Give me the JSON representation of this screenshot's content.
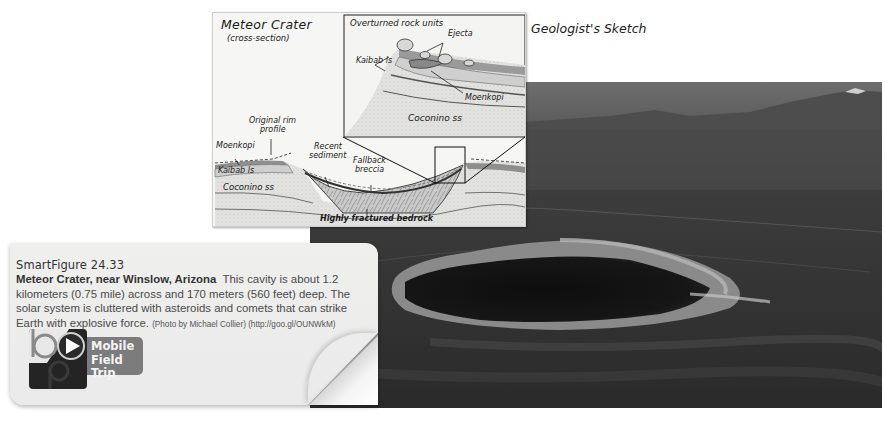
{
  "sketch": {
    "heading": "Geologist's Sketch",
    "title": "Meteor Crater",
    "subtitle": "(cross-section)",
    "inset": {
      "title": "Overturned rock units",
      "labels": {
        "ejecta": "Ejecta",
        "kaibab": "Kaibab ls",
        "moenkopi": "Moenkopi",
        "coconino": "Coconino ss"
      }
    },
    "labels": {
      "original_rim": "Original rim",
      "original_rim_2": "profile",
      "moenkopi": "Moenkopi",
      "kaibab": "Kaibab ls",
      "coconino": "Coconino ss",
      "recent": "Recent",
      "recent_2": "sediment",
      "fallback": "Fallback",
      "fallback_2": "breccia",
      "bedrock": "Highly fractured bedrock"
    }
  },
  "caption_card": {
    "figure_number": "SmartFigure 24.33",
    "title": "Meteor Crater, near Winslow, Arizona",
    "body": "This cavity is about 1.2 kilometers (0.75 mile) across and 170 meters (560 feet) deep. The solar system is cluttered with asteroids and comets that can strike Earth with explosive force.",
    "credit": "(Photo by Michael Collier) (http://goo.gl/OUNWkM)",
    "mobile_field_trip": {
      "line1": "Mobile",
      "line2": "Field Trip",
      "icon": "play-icon"
    }
  },
  "colors": {
    "card_bg": "#ececec",
    "pill_bg": "#7c7c7c",
    "logo_bg": "#242424",
    "photo_dark": "#2b2b2b"
  }
}
